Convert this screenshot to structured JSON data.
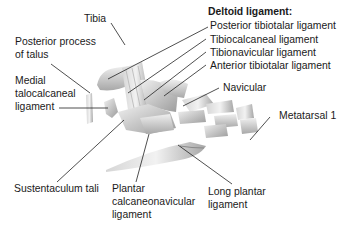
{
  "labels": {
    "tibia": "Tibia",
    "posterior_process_1": "Posterior process",
    "posterior_process_2": "of talus",
    "medial_talo_1": "Medial",
    "medial_talo_2": "talocalcaneal",
    "medial_talo_3": "ligament",
    "deltoid_heading": "Deltoid ligament:",
    "posterior_tibiotalar": "Posterior tibiotalar ligament",
    "tibiocalcaneal": "Tibiocalcaneal ligament",
    "tibionavicular": "Tibionavicular ligament",
    "anterior_tibiotalar": "Anterior tibiotalar ligament",
    "navicular": "Navicular",
    "metatarsal": "Metatarsal 1",
    "sustentaculum": "Sustentaculum tali",
    "plantar_1": "Plantar",
    "plantar_2": "calcaneonavicular",
    "plantar_3": "ligament",
    "long_plantar_1": "Long plantar",
    "long_plantar_2": "ligament"
  },
  "colors": {
    "bone_light": "#e6e6e6",
    "bone_mid": "#c8c8c8",
    "bone_dark": "#9a9a9a",
    "leader": "#222222"
  }
}
